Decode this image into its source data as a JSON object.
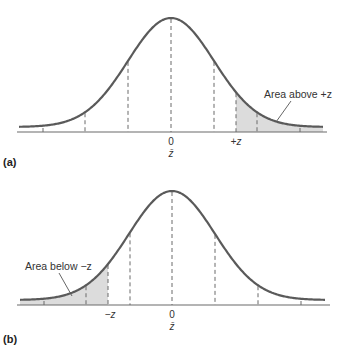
{
  "panels": [
    {
      "id": "a",
      "label": "(a)",
      "mean_label": "0",
      "mean_symbol": "z̄",
      "z_label": "+z",
      "annotation": "Area above +z",
      "shaded_tail": "right",
      "shade_color": "#dcdcdc"
    },
    {
      "id": "b",
      "label": "(b)",
      "mean_label": "0",
      "mean_symbol": "z̄",
      "z_label": "−z",
      "annotation": "Area below −z",
      "shaded_tail": "left",
      "shade_color": "#dcdcdc"
    }
  ]
}
